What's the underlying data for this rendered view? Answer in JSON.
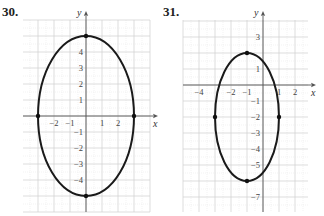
{
  "chart_data": [
    {
      "type": "line",
      "problem_label": "30.",
      "title": "",
      "xlabel": "x",
      "ylabel": "y",
      "xlim": [
        -4,
        4
      ],
      "ylim": [
        -6,
        6
      ],
      "grid": true,
      "curve": "ellipse",
      "center": [
        0,
        0
      ],
      "semi_axis_x": 3,
      "semi_axis_y": 5,
      "x_tick_labels": [
        "-2",
        "-1",
        "1",
        "2"
      ],
      "y_tick_labels": [
        "4",
        "3",
        "2",
        "1",
        "-1",
        "-2",
        "-3",
        "-4"
      ],
      "marked_points": [
        [
          0,
          5
        ],
        [
          0,
          -5
        ],
        [
          -3,
          0
        ],
        [
          3,
          0
        ]
      ]
    },
    {
      "type": "line",
      "problem_label": "31.",
      "title": "",
      "xlabel": "x",
      "ylabel": "y",
      "xlim": [
        -5,
        3
      ],
      "ylim": [
        -8,
        4
      ],
      "grid": true,
      "curve": "ellipse",
      "center": [
        -1,
        -2
      ],
      "semi_axis_x": 2,
      "semi_axis_y": 4,
      "x_tick_labels": [
        "-4",
        "-2",
        "-1",
        "1",
        "2"
      ],
      "y_tick_labels": [
        "3",
        "1",
        "-1",
        "-2",
        "-3",
        "-4",
        "-5",
        "-7"
      ],
      "marked_points": [
        [
          -1,
          2
        ],
        [
          -1,
          -6
        ],
        [
          -3,
          -2
        ],
        [
          1,
          -2
        ]
      ]
    }
  ],
  "labels": {
    "p30": "30.",
    "p31": "31."
  }
}
